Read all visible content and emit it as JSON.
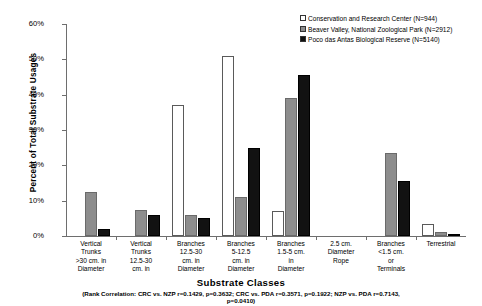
{
  "chart_data": {
    "type": "bar",
    "title": "",
    "xlabel": "Substrate Classes",
    "ylabel": "Percent of Total Substrate Usages",
    "ylim": [
      0,
      60
    ],
    "yticks": [
      "0%",
      "10%",
      "20%",
      "30%",
      "40%",
      "50%",
      "60%"
    ],
    "ytick_values": [
      0,
      10,
      20,
      30,
      40,
      50,
      60
    ],
    "grid": false,
    "legend_position": "top-right",
    "categories": [
      "Vertical Trunks >30 cm. in Diameter",
      "Vertical Trunks 12.5-30 cm. in",
      "Branches 12.5-30 cm. in Diameter",
      "Branches 5-12.5 cm. in Diameter",
      "Branches 1.5-5 cm. in Diameter",
      "2.5 cm. Diameter Rope",
      "Branches <1.5 cm. or Terminals",
      "Terrestrial"
    ],
    "category_lines": [
      [
        "Vertical",
        "Trunks",
        ">30 cm. in",
        "Diameter"
      ],
      [
        "Vertical",
        "Trunks",
        "12.5-30",
        "cm. in"
      ],
      [
        "Branches",
        "12.5-30",
        "cm. in",
        "Diameter"
      ],
      [
        "Branches",
        "5-12.5",
        "cm. in",
        "Diameter"
      ],
      [
        "Branches",
        "1.5-5 cm.",
        "in",
        "Diameter"
      ],
      [
        "2.5 cm.",
        "Diameter",
        "Rope"
      ],
      [
        "Branches",
        "<1.5 cm.",
        "or",
        "Terminals"
      ],
      [
        "Terrestrial"
      ]
    ],
    "series": [
      {
        "name": "Conservation and Research Center (N=944)",
        "key": "crc",
        "color": "#ffffff",
        "values": [
          0,
          0,
          37,
          51,
          7,
          0,
          0,
          3.5
        ]
      },
      {
        "name": "Beaver Valley, National Zoological Park (N=2912)",
        "key": "nzp",
        "color": "#8d8d8d",
        "values": [
          12.5,
          7.5,
          6,
          11,
          39,
          0,
          23.5,
          1
        ]
      },
      {
        "name": "Poco das Antas Biological Reserve (N=5140)",
        "key": "pda",
        "color": "#121212",
        "values": [
          2,
          6,
          5,
          25,
          45.5,
          0,
          15.5,
          0.6
        ]
      }
    ],
    "footnote_line1": "(Rank Correlation: CRC vs. NZP r=0.1429, p=0.3632; CRC vs. PDA r=0.3571, p=0.1922; NZP vs. PDA r=0.7143,",
    "footnote_line2": "p=0.0410)"
  },
  "legend": {
    "items": [
      {
        "label": "Conservation and Research Center (N=944)",
        "key": "crc"
      },
      {
        "label": "Beaver Valley, National Zoological Park (N=2912)",
        "key": "nzp"
      },
      {
        "label": "Poco das Antas Biological Reserve (N=5140)",
        "key": "pda"
      }
    ]
  }
}
